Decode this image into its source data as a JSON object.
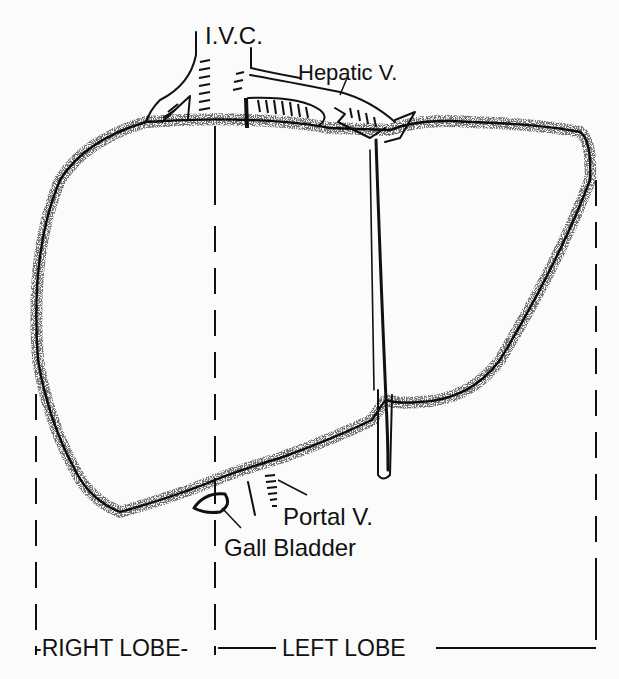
{
  "diagram": {
    "labels": {
      "ivc": "I.V.C.",
      "hepatic_vein": "Hepatic V.",
      "portal_vein": "Portal V.",
      "gall_bladder": "Gall Bladder",
      "right_lobe": "-RIGHT LOBE-",
      "left_lobe": "LEFT LOBE"
    },
    "colors": {
      "ink": "#111111",
      "paper": "#fbfbfb"
    }
  }
}
